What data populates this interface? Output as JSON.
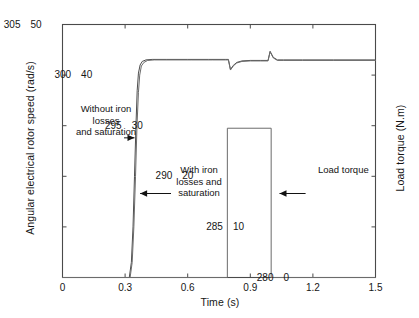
{
  "chart_data": {
    "type": "line",
    "title": "",
    "xlabel": "Time (s)",
    "ylabel": "Angular electrical rotor speed (rad/s)",
    "ylabel_right": "Load torque (N.m)",
    "xlim": [
      0,
      1.5
    ],
    "ylim": [
      280,
      305
    ],
    "ylim_right": [
      0,
      50
    ],
    "xticks": [
      "0",
      "0.3",
      "0.6",
      "0.9",
      "1.2",
      "1.5"
    ],
    "xtick_values": [
      0,
      0.3,
      0.6,
      0.9,
      1.2,
      1.5
    ],
    "yticks": [
      "280",
      "285",
      "290",
      "295",
      "300",
      "305"
    ],
    "ytick_values": [
      280,
      285,
      290,
      295,
      300,
      305
    ],
    "yticks_right": [
      "0",
      "10",
      "20",
      "30",
      "40",
      "50"
    ],
    "ytick_right_values": [
      0,
      10,
      20,
      30,
      40,
      50
    ],
    "grid": false,
    "legend": "none",
    "series": [
      {
        "name": "Without iron losses and saturation",
        "axis": "left",
        "color": "#4d4d4d",
        "points": [
          [
            0.0,
            280.0
          ],
          [
            0.32,
            280.0
          ],
          [
            0.33,
            281.5
          ],
          [
            0.338,
            285.0
          ],
          [
            0.345,
            290.0
          ],
          [
            0.352,
            295.0
          ],
          [
            0.358,
            298.5
          ],
          [
            0.364,
            300.2
          ],
          [
            0.372,
            301.0
          ],
          [
            0.382,
            301.35
          ],
          [
            0.4,
            301.5
          ],
          [
            0.43,
            301.55
          ],
          [
            0.5,
            301.55
          ],
          [
            0.6,
            301.55
          ],
          [
            0.7,
            301.55
          ],
          [
            0.78,
            301.55
          ],
          [
            0.795,
            301.55
          ],
          [
            0.805,
            300.55
          ],
          [
            0.818,
            300.95
          ],
          [
            0.835,
            301.25
          ],
          [
            0.86,
            301.4
          ],
          [
            0.9,
            301.45
          ],
          [
            0.95,
            301.45
          ],
          [
            0.985,
            301.45
          ],
          [
            0.995,
            302.35
          ],
          [
            1.01,
            301.75
          ],
          [
            1.03,
            301.5
          ],
          [
            1.06,
            301.5
          ],
          [
            1.15,
            301.5
          ],
          [
            1.3,
            301.5
          ],
          [
            1.5,
            301.5
          ]
        ]
      },
      {
        "name": "With iron losses and saturation",
        "axis": "left",
        "color": "#6b6b6b",
        "points": [
          [
            0.0,
            280.0
          ],
          [
            0.324,
            280.0
          ],
          [
            0.334,
            281.5
          ],
          [
            0.342,
            285.0
          ],
          [
            0.35,
            290.0
          ],
          [
            0.357,
            295.0
          ],
          [
            0.364,
            298.3
          ],
          [
            0.37,
            300.0
          ],
          [
            0.378,
            300.9
          ],
          [
            0.39,
            301.25
          ],
          [
            0.408,
            301.45
          ],
          [
            0.44,
            301.5
          ],
          [
            0.52,
            301.5
          ],
          [
            0.62,
            301.5
          ],
          [
            0.72,
            301.5
          ],
          [
            0.78,
            301.5
          ],
          [
            0.795,
            301.5
          ],
          [
            0.805,
            300.5
          ],
          [
            0.818,
            300.9
          ],
          [
            0.835,
            301.2
          ],
          [
            0.86,
            301.35
          ],
          [
            0.9,
            301.4
          ],
          [
            0.95,
            301.4
          ],
          [
            0.985,
            301.4
          ],
          [
            0.995,
            302.3
          ],
          [
            1.01,
            301.7
          ],
          [
            1.03,
            301.45
          ],
          [
            1.06,
            301.45
          ],
          [
            1.15,
            301.45
          ],
          [
            1.3,
            301.45
          ],
          [
            1.5,
            301.45
          ]
        ]
      },
      {
        "name": "Load torque",
        "axis": "right",
        "color": "#6b6b6b",
        "points": [
          [
            0.0,
            0
          ],
          [
            0.79,
            0
          ],
          [
            0.79,
            29.5
          ],
          [
            1.0,
            29.5
          ],
          [
            1.0,
            0
          ],
          [
            1.5,
            0
          ]
        ]
      }
    ],
    "annotations": [
      {
        "name": "without-iron-losses",
        "lines": [
          "Without iron",
          "losses",
          "and saturation"
        ],
        "arrow": {
          "from": [
            0.295,
            293.8
          ],
          "to": [
            0.345,
            293.8
          ]
        }
      },
      {
        "name": "with-iron-losses",
        "lines": [
          "With iron",
          "losses and",
          "saturation"
        ],
        "arrow": {
          "from": [
            0.52,
            288.3
          ],
          "to": [
            0.372,
            288.3
          ]
        }
      },
      {
        "name": "load-torque",
        "lines": [
          "Load torque"
        ],
        "arrow": {
          "from": [
            1.165,
            288.3
          ],
          "to": [
            1.04,
            288.3
          ]
        }
      }
    ]
  }
}
